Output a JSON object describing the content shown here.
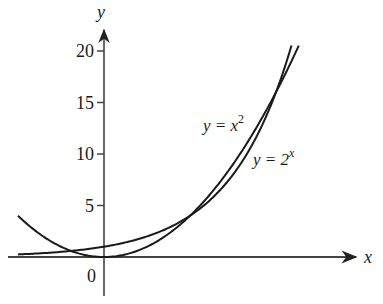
{
  "chart_data": {
    "type": "line",
    "title": "",
    "xlabel": "x",
    "ylabel": "y",
    "origin_label": "0",
    "xlim": [
      -2.0,
      6.3
    ],
    "ylim": [
      -1.0,
      21.0
    ],
    "yticks": [
      5,
      10,
      15,
      20
    ],
    "ytick_labels": [
      "5",
      "10",
      "15",
      "20"
    ],
    "grid": false,
    "legend": "inline annotations",
    "series": [
      {
        "name": "y = x^2",
        "label_main": "y = x",
        "label_sup": "2",
        "formula": "x^2",
        "x_range": [
          -2.0,
          4.53
        ],
        "points": [
          [
            -2,
            4
          ],
          [
            -1,
            1
          ],
          [
            0,
            0
          ],
          [
            1,
            1
          ],
          [
            2,
            4
          ],
          [
            3,
            9
          ],
          [
            4,
            16
          ],
          [
            4.53,
            20.5
          ]
        ]
      },
      {
        "name": "y = 2^x",
        "label_main": "y = 2",
        "label_sup": "x",
        "formula": "2^x",
        "x_range": [
          -2.0,
          4.36
        ],
        "points": [
          [
            -2,
            0.25
          ],
          [
            -1,
            0.5
          ],
          [
            0,
            1
          ],
          [
            1,
            2
          ],
          [
            2,
            4
          ],
          [
            3,
            8
          ],
          [
            4,
            16
          ],
          [
            4.36,
            20.5
          ]
        ]
      }
    ],
    "annotations": [
      {
        "text": "intersection",
        "x": 2,
        "y": 4
      },
      {
        "text": "intersection",
        "x": 4,
        "y": 16
      }
    ]
  },
  "layout": {
    "origin_px": [
      104,
      257
    ],
    "px_per_x": 43,
    "px_per_y": 10.3,
    "axis_color": "#333333",
    "curve_color": "#1a1a1a"
  }
}
